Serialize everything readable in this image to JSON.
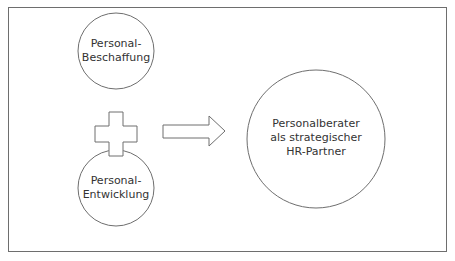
{
  "diagram": {
    "nodes": [
      {
        "id": "beschaffung",
        "lines": [
          "Personal-",
          "Beschaffung"
        ]
      },
      {
        "id": "entwicklung",
        "lines": [
          "Personal-",
          "Entwicklung"
        ]
      },
      {
        "id": "berater",
        "lines": [
          "Personalberater",
          "als strategischer",
          "HR-Partner"
        ]
      }
    ],
    "operators": {
      "combine": "plus",
      "result": "arrow-right"
    },
    "colors": {
      "stroke": "#6e6e6e",
      "text": "#333333",
      "background": "#ffffff"
    }
  }
}
